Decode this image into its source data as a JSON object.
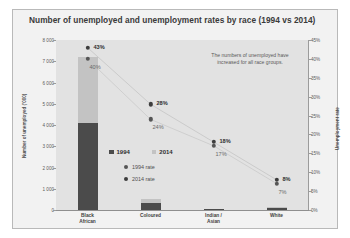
{
  "chart_data": {
    "type": "bar",
    "title": "Number of unemployed and unemployment rates by race (1994 vs 2014)",
    "categories": [
      "Black African",
      "Coloured",
      "Indian / Asian",
      "White"
    ],
    "xlabel": "",
    "ylabel": "Number of unemployed ('000)",
    "y2label": "Unemployment rate",
    "ylim": [
      0,
      8000
    ],
    "y2lim": [
      0,
      45
    ],
    "grid": false,
    "legend_position": "inside-center-left",
    "series": [
      {
        "name": "1994",
        "type": "bar",
        "axis": "left",
        "color": "#4b4b4b",
        "values": [
          4100,
          330,
          40,
          95
        ]
      },
      {
        "name": "2014",
        "type": "bar",
        "axis": "left",
        "color": "#c3c3c3",
        "values": [
          7200,
          500,
          55,
          130
        ]
      },
      {
        "name": "1994 rate",
        "type": "scatter",
        "axis": "right",
        "color": "#555555",
        "values": [
          40,
          24,
          17,
          7
        ],
        "labels": [
          "40%",
          "24%",
          "17%",
          "7%"
        ]
      },
      {
        "name": "2014 rate",
        "type": "scatter",
        "axis": "right",
        "color": "#3d3d3d",
        "values": [
          43,
          28,
          18,
          8
        ],
        "labels": [
          "43%",
          "28%",
          "18%",
          "8%"
        ]
      }
    ],
    "y_ticks": [
      "8 000",
      "7 000",
      "6 000",
      "5 000",
      "4 000",
      "3 000",
      "2 000",
      "1 000",
      "0"
    ],
    "y_tick_values": [
      8000,
      7000,
      6000,
      5000,
      4000,
      3000,
      2000,
      1000,
      0
    ],
    "y2_ticks": [
      "45%",
      "40%",
      "35%",
      "30%",
      "25%",
      "20%",
      "15%",
      "10%",
      "5%",
      "0%"
    ],
    "y2_tick_values": [
      45,
      40,
      35,
      30,
      25,
      20,
      15,
      10,
      5,
      0
    ],
    "annotations": [
      {
        "text": "The numbers of unemployed have increased for all race groups.",
        "position": "top-right"
      }
    ]
  },
  "legend": {
    "series_entries": [
      {
        "label": "1994",
        "color": "#4b4b4b"
      },
      {
        "label": "2014",
        "color": "#c3c3c3"
      }
    ],
    "rate_entries": [
      {
        "label": "1994 rate",
        "color": "#555555"
      },
      {
        "label": "2014 rate",
        "color": "#3d3d3d"
      }
    ]
  }
}
